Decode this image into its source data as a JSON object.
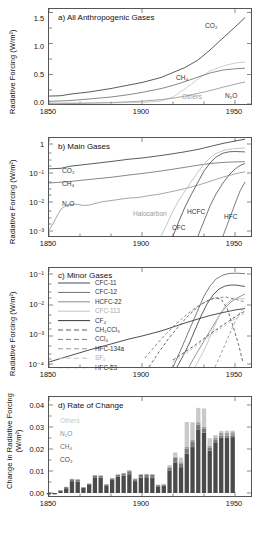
{
  "figure": {
    "ylabel_main": "Radiative Forcing (W/m²)",
    "ylabel_d_line1": "Change in Radiative Forcing",
    "ylabel_d_line2": "(W/m²)"
  },
  "panels": {
    "a": {
      "title": "a) All Anthropogenic Gases",
      "xticks": [
        "1850",
        "1900",
        "1950",
        "2000"
      ],
      "yticks": [
        "0.0",
        "0.5",
        "1.0",
        "1.5"
      ],
      "curve_labels": [
        {
          "name": "CO2",
          "text": "CO₂"
        },
        {
          "name": "CH4",
          "text": "CH₄"
        },
        {
          "name": "N2O",
          "text": "N₂O"
        },
        {
          "name": "others",
          "text": "Others"
        }
      ]
    },
    "b": {
      "title": "b) Main Gases",
      "xticks": [
        "1850",
        "1900",
        "1950",
        "2000"
      ],
      "yticks": [
        "1",
        "10⁻¹",
        "10⁻²",
        "10⁻³"
      ],
      "curve_labels": [
        {
          "name": "CO2",
          "text": "CO₂"
        },
        {
          "name": "CH4",
          "text": "CH₄"
        },
        {
          "name": "N2O",
          "text": "N₂O"
        },
        {
          "name": "halocarbon",
          "text": "Halocarbon"
        },
        {
          "name": "CFC",
          "text": "CFC"
        },
        {
          "name": "HCFC",
          "text": "HCFC"
        },
        {
          "name": "HFC",
          "text": "HFC"
        }
      ]
    },
    "c": {
      "title": "c) Minor Gases",
      "xticks": [
        "1850",
        "1900",
        "1950",
        "2000"
      ],
      "yticks": [
        "10⁻¹",
        "10⁻²",
        "10⁻³",
        "10⁻⁴"
      ],
      "legend": [
        {
          "label": "CFC-11",
          "style": "solid",
          "color": "#4a4a4a"
        },
        {
          "label": "CFC-12",
          "style": "solid",
          "color": "#6e6e6e"
        },
        {
          "label": "HCFC-22",
          "style": "solid",
          "color": "#8a8a8a"
        },
        {
          "label": "CFC-113",
          "style": "solid",
          "color": "#c2c2c2"
        },
        {
          "label": "CF₄",
          "style": "solid",
          "color": "#3a3a3a"
        },
        {
          "label": "CH₃CCl₃",
          "style": "dashed",
          "color": "#5c5c5c"
        },
        {
          "label": "CCl₄",
          "style": "dashed",
          "color": "#7d7d7d"
        },
        {
          "label": "HFC-134a",
          "style": "dashed",
          "color": "#969696"
        },
        {
          "label": "SF₆",
          "style": "dashed",
          "color": "#c6c6c6"
        },
        {
          "label": "HFC-23",
          "style": "dashed",
          "color": "#4f4f4f"
        }
      ]
    },
    "d": {
      "title": "d) Rate of Change",
      "xticks": [
        "1850",
        "1900",
        "1950",
        "2000"
      ],
      "yticks": [
        "0.00",
        "0.01",
        "0.02",
        "0.03",
        "0.04"
      ],
      "legend": [
        {
          "label": "Others",
          "color": "#c9c9c9"
        },
        {
          "label": "N₂O",
          "color": "#9d9d9d"
        },
        {
          "label": "CH₄",
          "color": "#7a7a7a"
        },
        {
          "label": "CO₂",
          "color": "#4a4a4a"
        }
      ]
    }
  },
  "colors": {
    "axis": "#555555",
    "co2": "#4a4a4a",
    "ch4": "#7a7a7a",
    "n2o": "#9d9d9d",
    "others": "#c9c9c9",
    "text": "#111111"
  },
  "chart_data": [
    {
      "type": "line",
      "panel": "a",
      "title": "a) All Anthropogenic Gases",
      "xlabel": "",
      "ylabel": "Radiative Forcing (W/m²)",
      "xlim": [
        1850,
        2012
      ],
      "ylim": [
        0.0,
        1.8
      ],
      "grid": false,
      "legend": "inline-curve-labels",
      "x": [
        1850,
        1860,
        1870,
        1880,
        1890,
        1900,
        1910,
        1920,
        1930,
        1940,
        1950,
        1960,
        1970,
        1980,
        1990,
        2000,
        2011
      ],
      "series": [
        {
          "name": "CO₂",
          "values": [
            0.15,
            0.16,
            0.19,
            0.22,
            0.25,
            0.28,
            0.33,
            0.38,
            0.44,
            0.52,
            0.59,
            0.7,
            0.86,
            1.06,
            1.28,
            1.48,
            1.73
          ]
        },
        {
          "name": "CH₄",
          "values": [
            0.05,
            0.06,
            0.07,
            0.08,
            0.09,
            0.11,
            0.13,
            0.15,
            0.18,
            0.21,
            0.24,
            0.29,
            0.34,
            0.4,
            0.44,
            0.46,
            0.47
          ]
        },
        {
          "name": "N₂O",
          "values": [
            0.0,
            0.0,
            0.0,
            0.01,
            0.01,
            0.01,
            0.02,
            0.02,
            0.03,
            0.03,
            0.04,
            0.05,
            0.07,
            0.09,
            0.12,
            0.15,
            0.17
          ]
        },
        {
          "name": "Others",
          "values": [
            0.0,
            0.0,
            0.0,
            0.0,
            0.0,
            0.0,
            0.0,
            0.0,
            0.0,
            0.0,
            0.01,
            0.03,
            0.08,
            0.17,
            0.26,
            0.31,
            0.33
          ]
        }
      ]
    },
    {
      "type": "line",
      "panel": "b",
      "title": "b) Main Gases",
      "xlabel": "",
      "ylabel": "Radiative Forcing (W/m²)",
      "xlim": [
        1850,
        2012
      ],
      "ylim": [
        0.001,
        2.0
      ],
      "yscale": "log",
      "grid": false,
      "x": [
        1850,
        1860,
        1870,
        1880,
        1890,
        1900,
        1910,
        1920,
        1930,
        1940,
        1950,
        1960,
        1970,
        1980,
        1990,
        2000,
        2011
      ],
      "series": [
        {
          "name": "CO₂",
          "values": [
            0.15,
            0.16,
            0.19,
            0.22,
            0.25,
            0.28,
            0.33,
            0.38,
            0.44,
            0.52,
            0.59,
            0.7,
            0.86,
            1.06,
            1.28,
            1.48,
            1.73
          ]
        },
        {
          "name": "CH₄",
          "values": [
            0.05,
            0.06,
            0.07,
            0.08,
            0.09,
            0.11,
            0.13,
            0.15,
            0.18,
            0.21,
            0.24,
            0.29,
            0.34,
            0.4,
            0.44,
            0.46,
            0.47
          ]
        },
        {
          "name": "N₂O",
          "values": [
            0.0011,
            0.006,
            0.01,
            0.013,
            0.013,
            0.015,
            0.017,
            0.02,
            0.024,
            0.028,
            0.033,
            0.042,
            0.055,
            0.075,
            0.1,
            0.13,
            0.165
          ]
        },
        {
          "name": "Halocarbon",
          "values": [
            null,
            null,
            null,
            null,
            null,
            null,
            null,
            null,
            null,
            0.0011,
            0.004,
            0.02,
            0.07,
            0.16,
            0.25,
            0.3,
            0.32
          ]
        },
        {
          "name": "CFC",
          "values": [
            null,
            null,
            null,
            null,
            null,
            null,
            null,
            null,
            null,
            null,
            0.0012,
            0.012,
            0.06,
            0.14,
            0.21,
            0.225,
            0.215
          ]
        },
        {
          "name": "HCFC",
          "values": [
            null,
            null,
            null,
            null,
            null,
            null,
            null,
            null,
            null,
            null,
            null,
            0.0011,
            0.004,
            0.014,
            0.035,
            0.06,
            0.08
          ]
        },
        {
          "name": "HFC",
          "values": [
            null,
            null,
            null,
            null,
            null,
            null,
            null,
            null,
            null,
            null,
            null,
            null,
            null,
            0.0011,
            0.004,
            0.013,
            0.03
          ]
        }
      ]
    },
    {
      "type": "line",
      "panel": "c",
      "title": "c) Minor Gases",
      "xlabel": "",
      "ylabel": "Radiative Forcing (W/m²)",
      "xlim": [
        1850,
        2012
      ],
      "ylim": [
        0.0001,
        0.2
      ],
      "yscale": "log",
      "grid": false,
      "x": [
        1930,
        1940,
        1950,
        1960,
        1970,
        1980,
        1990,
        2000,
        2011
      ],
      "series": [
        {
          "name": "CFC-11",
          "values": [
            null,
            null,
            0.0001,
            0.0009,
            0.0065,
            0.03,
            0.06,
            0.062,
            0.055
          ]
        },
        {
          "name": "CFC-12",
          "values": [
            null,
            null,
            0.00012,
            0.002,
            0.014,
            0.055,
            0.11,
            0.135,
            0.13
          ]
        },
        {
          "name": "HCFC-22",
          "values": [
            null,
            null,
            null,
            0.0003,
            0.0016,
            0.006,
            0.014,
            0.026,
            0.04
          ]
        },
        {
          "name": "CFC-113",
          "values": [
            null,
            null,
            null,
            0.0001,
            0.0008,
            0.004,
            0.012,
            0.016,
            0.015
          ]
        },
        {
          "name": "CF₄",
          "values": [
            0.0001,
            0.00025,
            0.00055,
            0.0011,
            0.0017,
            0.0024,
            0.003,
            0.0036,
            0.004
          ]
        },
        {
          "name": "CH₃CCl₃",
          "values": [
            0.00011,
            0.00035,
            0.001,
            0.0022,
            0.0042,
            0.0065,
            0.007,
            0.0009,
            0.00016
          ]
        },
        {
          "name": "CCl₄",
          "values": [
            0.00035,
            0.0009,
            0.0021,
            0.004,
            0.0065,
            0.009,
            0.01,
            0.0085,
            0.007
          ]
        },
        {
          "name": "HFC-134a",
          "values": [
            null,
            null,
            null,
            null,
            null,
            0.00011,
            0.0003,
            0.004,
            0.013
          ]
        },
        {
          "name": "SF₆",
          "values": [
            null,
            null,
            0.0001,
            0.00025,
            0.0006,
            0.0013,
            0.0024,
            0.0038,
            0.0055
          ]
        },
        {
          "name": "HFC-23",
          "values": [
            null,
            null,
            0.00012,
            0.0003,
            0.0007,
            0.0014,
            0.0024,
            0.0035,
            0.0048
          ]
        }
      ]
    },
    {
      "type": "bar",
      "panel": "d",
      "title": "d) Rate of Change",
      "xlabel": "",
      "ylabel": "Change in Radiative Forcing (W/m²)",
      "xlim": [
        1850,
        2012
      ],
      "ylim": [
        0.0,
        0.046
      ],
      "stacked": true,
      "grid": false,
      "categories": [
        1850,
        1855,
        1860,
        1865,
        1870,
        1875,
        1880,
        1885,
        1890,
        1895,
        1900,
        1905,
        1910,
        1915,
        1920,
        1925,
        1930,
        1935,
        1940,
        1945,
        1950,
        1955,
        1960,
        1965,
        1970,
        1975,
        1980,
        1985,
        1990,
        1995,
        2000,
        2005,
        2010
      ],
      "series": [
        {
          "name": "CO₂",
          "values": [
            -0.0007,
            -0.0007,
            0.001,
            0.0025,
            0.0062,
            0.006,
            0.0026,
            0.0042,
            0.0082,
            0.008,
            0.004,
            0.0068,
            0.0085,
            0.009,
            0.0098,
            0.0062,
            0.008,
            0.0082,
            0.008,
            0.0035,
            0.0038,
            0.0118,
            0.016,
            0.0135,
            0.0205,
            0.024,
            0.033,
            0.0315,
            0.0222,
            0.0265,
            0.029,
            0.029,
            0.0292
          ]
        },
        {
          "name": "CH₄",
          "values": [
            0.0,
            0.0,
            0.0004,
            0.0006,
            0.001,
            0.001,
            0.0004,
            0.0006,
            0.001,
            0.001,
            0.0005,
            0.0008,
            0.001,
            0.0012,
            0.0016,
            0.001,
            0.0014,
            0.0014,
            0.0014,
            0.0006,
            0.0006,
            0.0014,
            0.0024,
            0.002,
            0.0028,
            0.003,
            0.0028,
            0.002,
            0.0014,
            0.0012,
            0.001,
            0.001,
            0.001
          ]
        },
        {
          "name": "N₂O",
          "values": [
            0.0,
            0.0,
            0.0001,
            0.0001,
            0.0002,
            0.0002,
            0.0001,
            0.0002,
            0.0002,
            0.0002,
            0.0001,
            0.0002,
            0.0002,
            0.0003,
            0.0004,
            0.0003,
            0.0004,
            0.0004,
            0.0004,
            0.0002,
            0.0002,
            0.0004,
            0.0006,
            0.0006,
            0.0008,
            0.001,
            0.0012,
            0.0012,
            0.0012,
            0.0014,
            0.0014,
            0.0016,
            0.0016
          ]
        },
        {
          "name": "Others",
          "values": [
            0.0,
            0.0,
            0.0,
            0.0,
            0.0,
            0.0,
            0.0,
            0.0,
            0.0,
            0.0,
            0.0,
            0.0,
            0.0,
            0.0,
            0.0,
            0.0,
            0.0,
            0.0,
            0.0,
            0.0,
            0.0002,
            0.001,
            0.0022,
            0.0024,
            0.013,
            0.009,
            0.0075,
            0.0095,
            0.0038,
            0.0012,
            0.001,
            0.001,
            0.0008
          ]
        }
      ]
    }
  ]
}
